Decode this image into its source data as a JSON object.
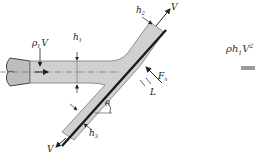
{
  "diagram": {
    "labels": {
      "jet_input": "ρ₁V",
      "jet_input_rho": "ρ",
      "jet_input_sub": "1",
      "jet_input_v": "V",
      "h1": "h",
      "h1_sub": "1",
      "h2": "h",
      "h2_sub": "2",
      "h3": "h",
      "h3_sub": "3",
      "v_up": "V",
      "v_down": "V",
      "force": "F",
      "force_sub": "n",
      "length": "L",
      "angle": "θ"
    },
    "side": {
      "expression_prefix": "ρh",
      "expression_sub": "1",
      "expression_v": "V",
      "expression_sup": "2"
    },
    "colors": {
      "fluid": "#cfcfcf",
      "plate": "#1a1a1a",
      "outline": "#555555",
      "nozzle": "#bdbdbd",
      "side_bar": "#9a9a9a"
    }
  }
}
